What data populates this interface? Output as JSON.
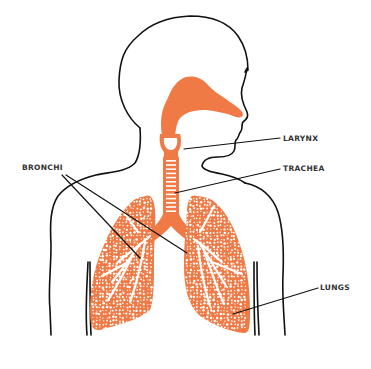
{
  "colors": {
    "organ": "#f07a45",
    "outline": "#111111",
    "label_text": "#333333",
    "background": "#ffffff"
  },
  "labels": {
    "larynx": "LARYNX",
    "trachea": "TRACHEA",
    "bronchi": "BRONCHI",
    "lungs": "LUNGS"
  }
}
